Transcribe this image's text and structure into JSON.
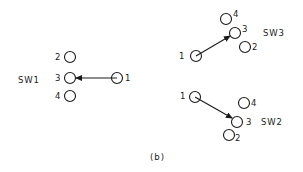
{
  "caption": "(b)",
  "switches": [
    {
      "name": "SW1",
      "nodes": [
        {
          "label": "1"
        },
        {
          "label": "2"
        },
        {
          "label": "3"
        },
        {
          "label": "4"
        }
      ],
      "connection": {
        "from": "1",
        "to": "3"
      }
    },
    {
      "name": "SW3",
      "nodes": [
        {
          "label": "1"
        },
        {
          "label": "2"
        },
        {
          "label": "3"
        },
        {
          "label": "4"
        }
      ],
      "connection": {
        "from": "1",
        "to": "3"
      }
    },
    {
      "name": "SW2",
      "nodes": [
        {
          "label": "1"
        },
        {
          "label": "2"
        },
        {
          "label": "3"
        },
        {
          "label": "4"
        }
      ],
      "connection": {
        "from": "1",
        "to": "3"
      }
    }
  ],
  "colors": {
    "ink": "#1a1a1a",
    "background": "#ffffff"
  }
}
